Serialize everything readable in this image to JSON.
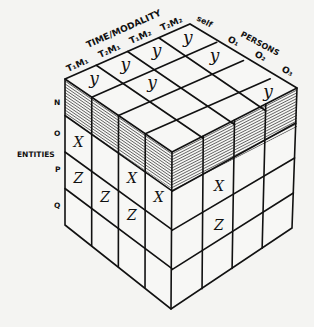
{
  "diagram": {
    "type": "isometric-cube-grid",
    "axes": {
      "time_modality": {
        "title": "TIME/MODALITY",
        "columns": [
          "T₁M₁",
          "T₂M₁",
          "T₁M₂",
          "T₂M₂"
        ]
      },
      "persons": {
        "title": "PERSONS",
        "columns": [
          "self",
          "O₁",
          "O₂",
          "O₃"
        ]
      },
      "entities": {
        "title": "ENTITIES",
        "rows": [
          "N",
          "O",
          "P",
          "Q"
        ]
      }
    },
    "top_face_marks": [
      {
        "time_modality": "T₁M₁",
        "person": "self",
        "mark": "y"
      },
      {
        "time_modality": "T₂M₁",
        "person": "self",
        "mark": "y"
      },
      {
        "time_modality": "T₁M₂",
        "person": "self",
        "mark": "y"
      },
      {
        "time_modality": "T₂M₂",
        "person": "self",
        "mark": "y"
      },
      {
        "time_modality": "T₂M₁",
        "person": "O₁",
        "mark": "y"
      },
      {
        "time_modality": "T₂M₂",
        "person": "O₁",
        "mark": "y"
      },
      {
        "time_modality": "T₂M₂",
        "person": "O₃",
        "mark": "y"
      }
    ],
    "left_face_marks": [
      {
        "col": 0,
        "row": "O",
        "mark": "X"
      },
      {
        "col": 0,
        "row": "P",
        "mark": "Z"
      },
      {
        "col": 1,
        "row": "P",
        "mark": "Z"
      },
      {
        "col": 2,
        "row": "O",
        "mark": "X"
      },
      {
        "col": 2,
        "row": "P",
        "mark": "Z"
      },
      {
        "col": 3,
        "row": "O",
        "mark": "X"
      }
    ],
    "right_face_marks": [
      {
        "col": 1,
        "row": "O",
        "mark": "X"
      },
      {
        "col": 1,
        "row": "P",
        "mark": "Z"
      }
    ],
    "shaded_layer": "N",
    "colors": {
      "ink": "#111111",
      "paper": "#f4f4f2"
    }
  }
}
